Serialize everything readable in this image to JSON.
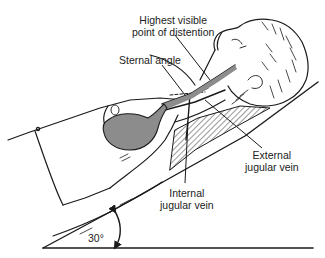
{
  "figure": {
    "labels": {
      "highest_point": [
        "Highest visible",
        "point of distention"
      ],
      "sternal_angle": "Sternal angle",
      "external_jugular": [
        "External",
        "jugular vein"
      ],
      "internal_jugular": [
        "Internal",
        "jugular vein"
      ],
      "angle": "30°"
    },
    "colors": {
      "line": "#1a1a1a",
      "heart_fill": "#8c8c8c",
      "hatch": "#333333",
      "background": "#ffffff"
    }
  }
}
